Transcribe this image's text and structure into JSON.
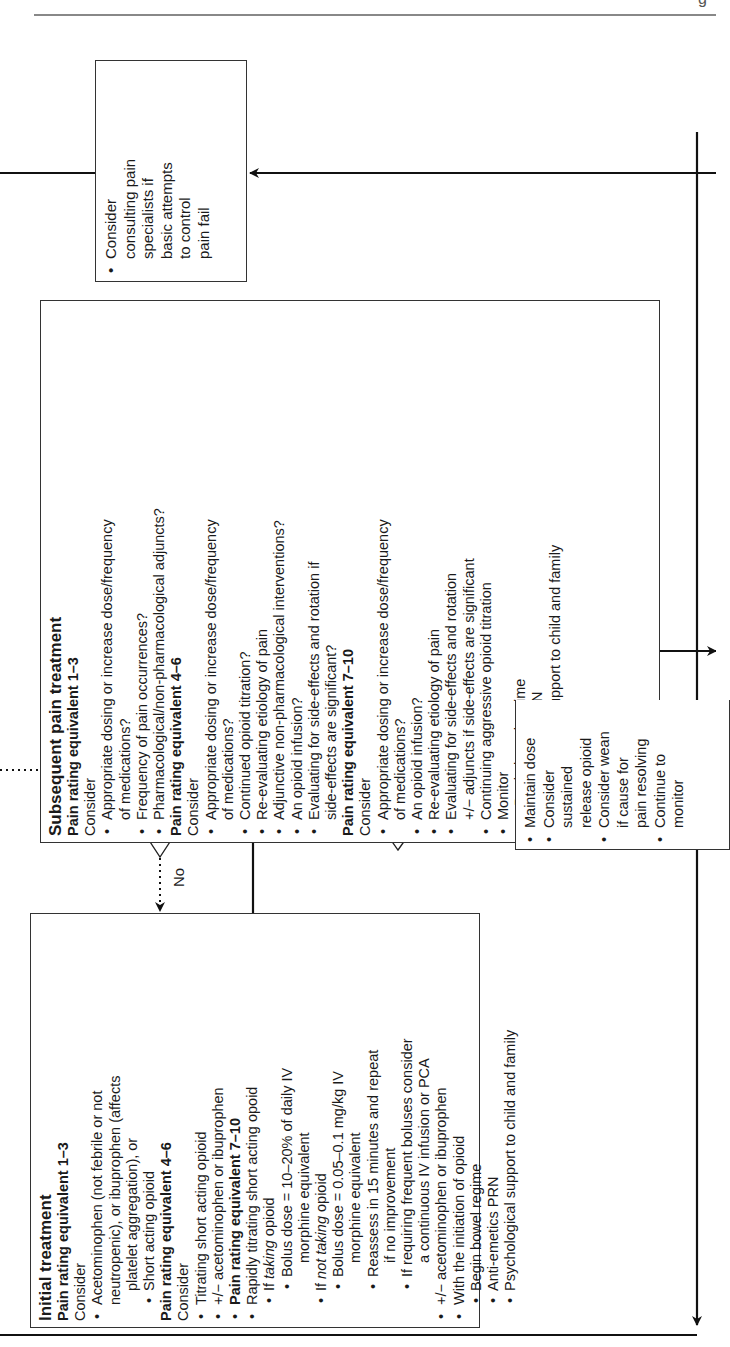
{
  "header": {
    "partial_glyph": "g"
  },
  "initial_treatment": {
    "title": "Initial treatment",
    "r1_heading": "Pain rating equivalent 1–3",
    "r1_consider": "Consider",
    "r1_items": [
      "Acetominophen (not febrile or not",
      "neutropenic), or ibuprophen (affects",
      "platelet aggregation), or",
      "Short acting opioid"
    ],
    "r2_heading": "Pain rating equivalent 4–6",
    "r2_consider": "Consider",
    "r2_items": [
      "Titrating short acting opioid",
      "+/− acetominophen or ibuprophen"
    ],
    "r3_heading": "Pain rating equivalent 7–10",
    "r3_items": {
      "rapid": "Rapidly titrating short acting opoid",
      "if_taking_pre": "If ",
      "if_taking_em": "taking",
      "if_taking_post": " opioid",
      "bolus1_a": "Bolus dose = 10–20% of daily IV",
      "bolus1_b": "morphine equivalent",
      "if_not_pre": "If ",
      "if_not_em": "not taking",
      "if_not_post": " opioid",
      "bolus2_a": "Bolus dose = 0.05–0.1 mg/kg IV",
      "bolus2_b": "morphine equivalent",
      "reassess_a": "Reassess in 15 minutes and repeat",
      "reassess_b": "if no improvement",
      "frequent_a": "If requiring frequent boluses consider",
      "frequent_b": "a continuous IV infusion or PCA",
      "adjunct": "+/− acetominophen or ibuprophen",
      "with_init": "With the initiation of opioid",
      "bowel": "Begin bowel regime",
      "antiemetics": "Anti-emetics PRN",
      "psych": "Psychological support to child and family"
    }
  },
  "subsequent_treatment": {
    "title": "Subsequent pain treatment",
    "r1_heading": "Pain rating equivalent 1–3",
    "r1_consider": "Consider",
    "r1_a": "Appropriate dosing or increase dose/frequency",
    "r1_a2": "of medications?",
    "r1_b": "Frequency of pain occurrences?",
    "r1_c": "Pharmacological/non-pharmacological adjuncts?",
    "r2_heading": "Pain rating equivalent 4–6",
    "r2_consider": "Consider",
    "r2_a": "Appropriate dosing or increase dose/frequency",
    "r2_a2": "of medications?",
    "r2_b": "Continued opioid titration?",
    "r2_c": "Re-evaluating etiology of pain",
    "r2_d": "Adjunctive non-pharmacological interventions?",
    "r2_e": "An opioid infusion?",
    "r2_f": "Evaluating for side-effects and rotation if",
    "r2_f2": "side-effects are significant?",
    "r3_heading": "Pain rating equivalent 7–10",
    "r3_consider": "Consider",
    "r3_a": "Appropriate dosing or increase dose/frequency",
    "r3_a2": "of medications?",
    "r3_b": "An opioid infusion?",
    "r3_c": "Re-evaluating etiology of pain",
    "r3_d": "Evaluating for side-effects and rotation",
    "r3_d2": "+/− adjuncts if side-effects are significant",
    "r3_e": "Continuing aggressive opioid titration",
    "r3_f": "Monitor",
    "bowel": "Begin bowel regime",
    "antiemetics": "Anti-emetics PRN",
    "psych": "Psychological support to child and family"
  },
  "consult_box": {
    "lines": [
      "Consider",
      "consulting pain",
      "specialists if",
      "basic attempts",
      "to control",
      "pain fail"
    ]
  },
  "already_diamond": {
    "line1": "Already",
    "line2": "on pain",
    "line3": "med?",
    "yes": "Yes",
    "no": "No"
  },
  "controlled_diamond": {
    "line1": "Pain",
    "line2": "controlled?",
    "yes": "Yes",
    "no": "No"
  },
  "maintain_box": {
    "a": "Maintain dose",
    "b1": "Consider",
    "b2": "sustained",
    "b3": "release opioid",
    "c1": "Consider wean",
    "c2": "if cause for",
    "c3": "pain resolving",
    "d1": "Continue to",
    "d2": "monitor"
  }
}
